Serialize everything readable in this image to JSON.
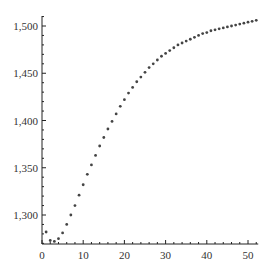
{
  "chart_data": {
    "type": "scatter",
    "title": "",
    "xlabel": "",
    "ylabel": "",
    "xlim": [
      0,
      52
    ],
    "ylim": [
      1266,
      1512
    ],
    "grid": false,
    "legend": null,
    "x_ticks": [
      0,
      10,
      20,
      30,
      40,
      50
    ],
    "x_tick_labels": [
      "0",
      "10",
      "20",
      "30",
      "40",
      "50"
    ],
    "y_ticks": [
      1300,
      1350,
      1400,
      1450,
      1500
    ],
    "y_tick_labels": [
      "1,300",
      "1,350",
      "1,400",
      "1,450",
      "1,500"
    ],
    "marker_color": "#444444",
    "series": [
      {
        "name": "series",
        "x": [
          1,
          2,
          3,
          4,
          5,
          6,
          7,
          8,
          9,
          10,
          11,
          12,
          13,
          14,
          15,
          16,
          17,
          18,
          19,
          20,
          21,
          22,
          23,
          24,
          25,
          26,
          27,
          28,
          29,
          30,
          31,
          32,
          33,
          34,
          35,
          36,
          37,
          38,
          39,
          40,
          41,
          42,
          43,
          44,
          45,
          46,
          47,
          48,
          49,
          50,
          51,
          52
        ],
        "values": [
          1282,
          1273,
          1272,
          1275,
          1281,
          1290,
          1300,
          1310,
          1321,
          1332,
          1343,
          1353,
          1363,
          1373,
          1382,
          1391,
          1399,
          1407,
          1415,
          1422,
          1429,
          1435,
          1441,
          1446,
          1451,
          1456,
          1460,
          1464,
          1468,
          1471,
          1474,
          1477,
          1480,
          1482,
          1484,
          1486,
          1488,
          1490,
          1492,
          1493,
          1495,
          1496,
          1497,
          1498,
          1499,
          1500,
          1501,
          1502,
          1503,
          1504,
          1505,
          1506
        ]
      }
    ]
  }
}
